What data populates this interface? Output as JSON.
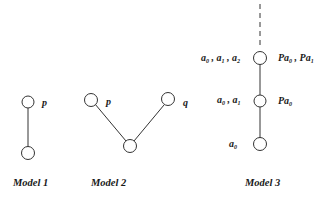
{
  "models": [
    {
      "caption": "Model 1",
      "labels": [
        {
          "text": "p"
        }
      ]
    },
    {
      "caption": "Model 2",
      "labels": [
        {
          "text": "p"
        },
        {
          "text": "q"
        }
      ]
    },
    {
      "caption": "Model 3",
      "left_labels": [
        {
          "parts": [
            "a",
            "0",
            " , ",
            "a",
            "1",
            " , ",
            "a",
            "2"
          ]
        },
        {
          "parts": [
            "a",
            "0",
            " , ",
            "a",
            "1"
          ]
        },
        {
          "parts": [
            "a",
            "0"
          ]
        }
      ],
      "right_labels": [
        {
          "parts": [
            "Pa",
            "0",
            " , ",
            "Pa",
            "1"
          ]
        },
        {
          "parts": [
            "Pa",
            "0"
          ]
        }
      ]
    }
  ]
}
